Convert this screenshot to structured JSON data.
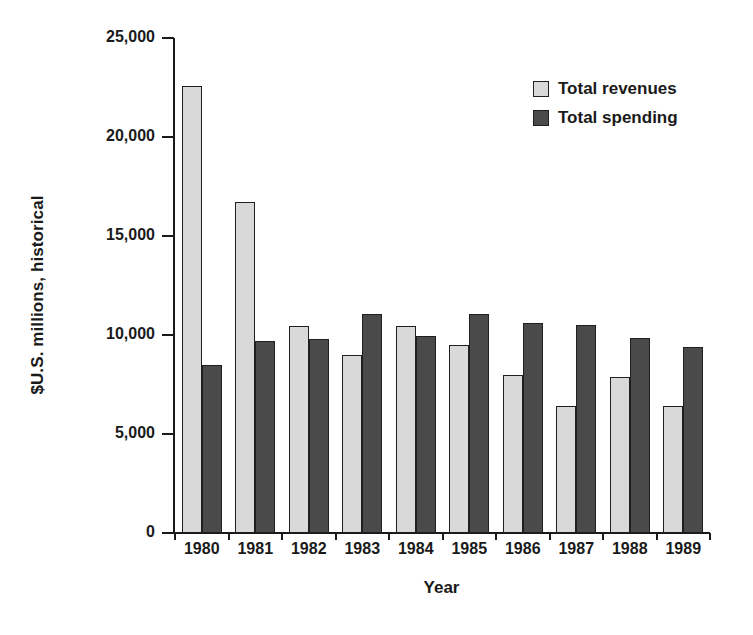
{
  "chart_data": {
    "type": "bar",
    "title": "",
    "subtitle": "",
    "xlabel": "Year",
    "ylabel": "$U.S. millions, historical",
    "categories": [
      "1980",
      "1981",
      "1982",
      "1983",
      "1984",
      "1985",
      "1986",
      "1987",
      "1988",
      "1989"
    ],
    "series": [
      {
        "name": "Total revenues",
        "color": "#d9d9d9",
        "values": [
          22600,
          16700,
          10450,
          9000,
          10450,
          9500,
          8000,
          6400,
          7900,
          6400
        ]
      },
      {
        "name": "Total spending",
        "color": "#4a4a4a",
        "values": [
          8500,
          9700,
          9800,
          11050,
          9950,
          11050,
          10600,
          10500,
          9850,
          9400
        ]
      }
    ],
    "ylim": [
      0,
      25000
    ],
    "yticks": [
      0,
      5000,
      10000,
      15000,
      20000,
      25000
    ],
    "ytick_labels": [
      "0",
      "5,000",
      "10,000",
      "15,000",
      "20,000",
      "25,000"
    ],
    "grid": false,
    "legend_position": "top-right"
  },
  "legend": {
    "entries": [
      {
        "label": "Total revenues",
        "color": "#d9d9d9"
      },
      {
        "label": "Total spending",
        "color": "#4a4a4a"
      }
    ]
  },
  "axes": {
    "y_title": "$U.S. millions, historical",
    "x_title": "Year"
  }
}
